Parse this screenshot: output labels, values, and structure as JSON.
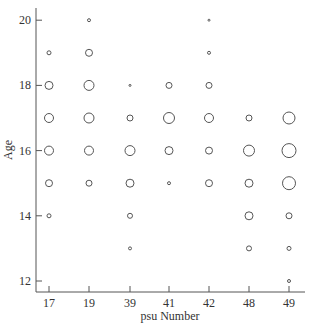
{
  "chart_data": {
    "type": "scatter",
    "subtype": "bubble",
    "title": "",
    "xlabel": "psu Number",
    "ylabel": "Age",
    "categories": [
      "17",
      "19",
      "39",
      "41",
      "42",
      "48",
      "49"
    ],
    "y_ticks": [
      12,
      14,
      16,
      18,
      20
    ],
    "ylim": [
      11.7,
      20.7
    ],
    "grid": false,
    "legend": null,
    "size_note": "bubble radius in pixels approximating relative frequency",
    "points": [
      {
        "psu": "17",
        "age": 19,
        "size": 2
      },
      {
        "psu": "17",
        "age": 18,
        "size": 4
      },
      {
        "psu": "17",
        "age": 17,
        "size": 4.5
      },
      {
        "psu": "17",
        "age": 16,
        "size": 4.5
      },
      {
        "psu": "17",
        "age": 15,
        "size": 3.5
      },
      {
        "psu": "17",
        "age": 14,
        "size": 2
      },
      {
        "psu": "19",
        "age": 20,
        "size": 1.5
      },
      {
        "psu": "19",
        "age": 19,
        "size": 3.5
      },
      {
        "psu": "19",
        "age": 18,
        "size": 5
      },
      {
        "psu": "19",
        "age": 17,
        "size": 5
      },
      {
        "psu": "19",
        "age": 16,
        "size": 4.5
      },
      {
        "psu": "19",
        "age": 15,
        "size": 3
      },
      {
        "psu": "39",
        "age": 18,
        "size": 1
      },
      {
        "psu": "39",
        "age": 17,
        "size": 3
      },
      {
        "psu": "39",
        "age": 16,
        "size": 5
      },
      {
        "psu": "39",
        "age": 15,
        "size": 4
      },
      {
        "psu": "39",
        "age": 14,
        "size": 2.5
      },
      {
        "psu": "39",
        "age": 13,
        "size": 1.5
      },
      {
        "psu": "41",
        "age": 18,
        "size": 3
      },
      {
        "psu": "41",
        "age": 17,
        "size": 5.5
      },
      {
        "psu": "41",
        "age": 16,
        "size": 4
      },
      {
        "psu": "41",
        "age": 15,
        "size": 1.5
      },
      {
        "psu": "42",
        "age": 20,
        "size": 1
      },
      {
        "psu": "42",
        "age": 19,
        "size": 1.5
      },
      {
        "psu": "42",
        "age": 18,
        "size": 3
      },
      {
        "psu": "42",
        "age": 17,
        "size": 4.5
      },
      {
        "psu": "42",
        "age": 16,
        "size": 3.5
      },
      {
        "psu": "42",
        "age": 15,
        "size": 3.5
      },
      {
        "psu": "48",
        "age": 17,
        "size": 3
      },
      {
        "psu": "48",
        "age": 16,
        "size": 5.5
      },
      {
        "psu": "48",
        "age": 15,
        "size": 4
      },
      {
        "psu": "48",
        "age": 14,
        "size": 4
      },
      {
        "psu": "48",
        "age": 13,
        "size": 2.5
      },
      {
        "psu": "49",
        "age": 17,
        "size": 6
      },
      {
        "psu": "49",
        "age": 16,
        "size": 7
      },
      {
        "psu": "49",
        "age": 15,
        "size": 6.5
      },
      {
        "psu": "49",
        "age": 14,
        "size": 3
      },
      {
        "psu": "49",
        "age": 13,
        "size": 2
      },
      {
        "psu": "49",
        "age": 12,
        "size": 1.5
      }
    ]
  },
  "layout": {
    "x_positions": [
      49,
      89,
      130,
      169,
      209,
      249,
      289
    ],
    "y_px_per_unit": 32.6,
    "y_origin_value": 12,
    "y_origin_px": 281,
    "axis_left_x": 36,
    "axis_bottom_y": 292,
    "axis_right_x": 305,
    "axis_top_y": 8
  }
}
